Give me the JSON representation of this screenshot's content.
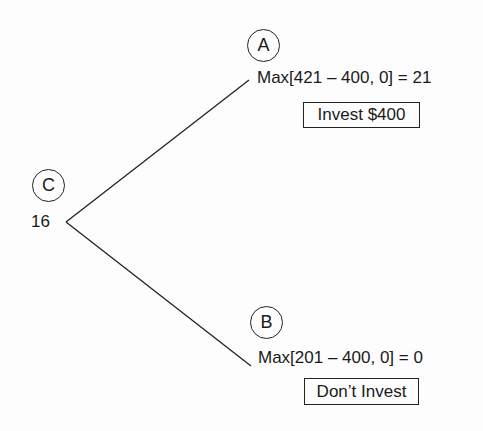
{
  "diagram": {
    "type": "decision-tree",
    "root": {
      "label": "C",
      "value": "16"
    },
    "branches": [
      {
        "node_label": "A",
        "payoff": "Max[421 – 400, 0] = 21",
        "decision": "Invest $400"
      },
      {
        "node_label": "B",
        "payoff": "Max[201 – 400, 0] = 0",
        "decision": "Don’t Invest"
      }
    ],
    "colors": {
      "line": "#222222",
      "text": "#1a1a1a",
      "background": "#fdfdfd"
    }
  }
}
